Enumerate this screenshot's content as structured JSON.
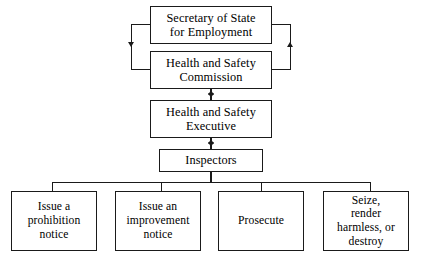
{
  "diagram": {
    "background_color": "#ffffff",
    "line_color": "#1a1a1a",
    "nodes": {
      "secretary_of_state": "Secretary of State\nfor Employment",
      "commission": "Health and Safety\nCommission",
      "executive": "Health and Safety\nExecutive",
      "inspectors": "Inspectors",
      "action_prohibition": "Issue a\nprohibition\nnotice",
      "action_improvement": "Issue an\nimprovement\nnotice",
      "action_prosecute": "Prosecute",
      "action_seize": "Seize,\nrender\nharmless, or\ndestroy"
    }
  }
}
